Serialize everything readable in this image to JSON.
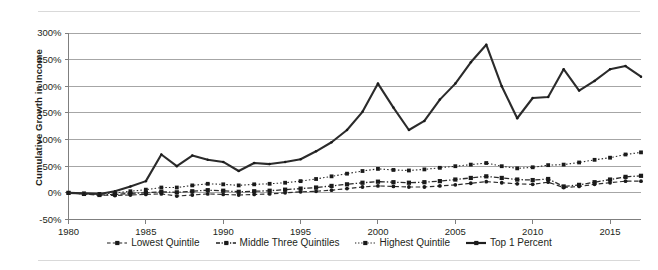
{
  "chart_data": {
    "type": "line",
    "title": "",
    "subtitle": "",
    "xlabel": "",
    "ylabel": "Cumulative Growth in Income",
    "xlim": [
      1980,
      2017
    ],
    "ylim": [
      -50,
      300
    ],
    "ytick_step": 50,
    "ytick_labels": [
      "300%",
      "250%",
      "200%",
      "150%",
      "100%",
      "50%",
      "0%",
      "-50%"
    ],
    "ytick_values": [
      300,
      250,
      200,
      150,
      100,
      50,
      0,
      -50
    ],
    "xtick_labels": [
      "1980",
      "1985",
      "1990",
      "1995",
      "2000",
      "2005",
      "2010",
      "2015"
    ],
    "xtick_values": [
      1980,
      1985,
      1990,
      1995,
      2000,
      2005,
      2010,
      2015
    ],
    "grid": "horizontal",
    "legend_position": "bottom",
    "units": "percent",
    "x": [
      1980,
      1981,
      1982,
      1983,
      1984,
      1985,
      1986,
      1987,
      1988,
      1989,
      1990,
      1991,
      1992,
      1993,
      1994,
      1995,
      1996,
      1997,
      1998,
      1999,
      2000,
      2001,
      2002,
      2003,
      2004,
      2005,
      2006,
      2007,
      2008,
      2009,
      2010,
      2011,
      2012,
      2013,
      2014,
      2015,
      2016,
      2017
    ],
    "series": [
      {
        "name": "Lowest Quintile",
        "style": "dashed",
        "marker": "circle",
        "color": "#2b2b2b",
        "values": [
          0,
          -2,
          -4,
          -5,
          -4,
          -3,
          -2,
          -6,
          -4,
          -2,
          -3,
          -4,
          -3,
          -2,
          0,
          2,
          3,
          5,
          8,
          11,
          13,
          12,
          11,
          11,
          13,
          15,
          18,
          21,
          19,
          17,
          16,
          20,
          10,
          12,
          16,
          19,
          22,
          22
        ]
      },
      {
        "name": "Middle Three Quintiles",
        "style": "dash-dot",
        "marker": "square",
        "color": "#1a1a1a",
        "values": [
          0,
          -2,
          -4,
          -3,
          -1,
          0,
          2,
          1,
          3,
          5,
          4,
          2,
          3,
          4,
          6,
          8,
          10,
          13,
          16,
          19,
          21,
          20,
          19,
          20,
          22,
          25,
          28,
          31,
          28,
          25,
          24,
          26,
          12,
          15,
          20,
          25,
          30,
          32
        ]
      },
      {
        "name": "Highest Quintile",
        "style": "dotted",
        "marker": "square",
        "color": "#2b2b2b",
        "values": [
          0,
          -1,
          -2,
          0,
          3,
          6,
          10,
          10,
          14,
          17,
          16,
          14,
          16,
          17,
          19,
          22,
          26,
          31,
          36,
          41,
          45,
          43,
          42,
          44,
          47,
          50,
          53,
          56,
          50,
          46,
          48,
          52,
          53,
          57,
          62,
          66,
          72,
          76
        ]
      },
      {
        "name": "Top 1 Percent",
        "style": "solid",
        "marker": "dot",
        "color": "#555555",
        "values": [
          0,
          -1,
          -2,
          3,
          12,
          22,
          72,
          50,
          70,
          62,
          58,
          41,
          56,
          54,
          58,
          63,
          78,
          95,
          118,
          152,
          205,
          160,
          118,
          135,
          175,
          205,
          245,
          278,
          200,
          140,
          178,
          180,
          232,
          192,
          210,
          232,
          238,
          218
        ]
      }
    ]
  },
  "legend": {
    "items": [
      {
        "label": "Lowest Quintile",
        "style": "dashed"
      },
      {
        "label": "Middle Three Quintiles",
        "style": "dash-dot"
      },
      {
        "label": "Highest Quintile",
        "style": "dotted"
      },
      {
        "label": "Top 1 Percent",
        "style": "solid"
      }
    ]
  },
  "axis": {
    "ylabel": "Cumulative Growth in Income"
  }
}
